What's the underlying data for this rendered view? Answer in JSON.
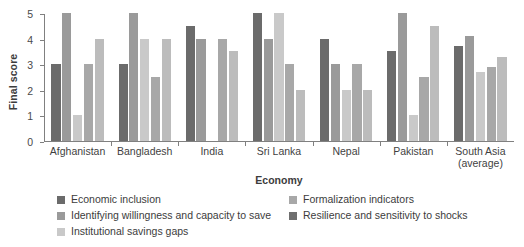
{
  "chart_data": {
    "type": "bar",
    "title": "",
    "xlabel": "Economy",
    "ylabel": "Final score",
    "ylim": [
      0,
      5
    ],
    "yticks": [
      "0",
      "1",
      "2",
      "3",
      "4",
      "5"
    ],
    "grid": false,
    "legend_position": "bottom",
    "categories": [
      "Afghanistan",
      "Bangladesh",
      "India",
      "Sri Lanka",
      "Nepal",
      "Pakistan",
      "South Asia|(average)"
    ],
    "series": [
      {
        "name": "Economic inclusion",
        "color": "#6b6b6b",
        "values": [
          3,
          3,
          4.5,
          5,
          4,
          3.5,
          3.7
        ]
      },
      {
        "name": "Identifying willingness and capacity to save",
        "color": "#9a9a9a",
        "values": [
          5,
          5,
          4,
          4,
          3,
          5,
          4.1
        ]
      },
      {
        "name": "Institutional savings gaps",
        "color": "#c9c9c9",
        "values": [
          1,
          4,
          0,
          5,
          2,
          1,
          2.7
        ]
      },
      {
        "name": "Formalization indicators",
        "color": "#a8a8a8",
        "values": [
          3,
          2.5,
          4,
          3,
          3,
          2.5,
          2.9
        ]
      },
      {
        "name": "Resilience and sensitivity to shocks",
        "color": "#bcbcbc",
        "values": [
          4,
          4,
          3.5,
          2,
          2,
          4.5,
          3.3
        ]
      }
    ]
  },
  "legend": {
    "entries": [
      {
        "label": "Economic inclusion",
        "color": "#6b6b6b"
      },
      {
        "label": "Formalization indicators",
        "color": "#a8a8a8"
      },
      {
        "label": "Identifying willingness and capacity to save",
        "color": "#9a9a9a"
      },
      {
        "label": "Resilience and sensitivity to shocks",
        "color": "#6f6f6f"
      },
      {
        "label": "Institutional savings gaps",
        "color": "#c9c9c9"
      }
    ]
  }
}
